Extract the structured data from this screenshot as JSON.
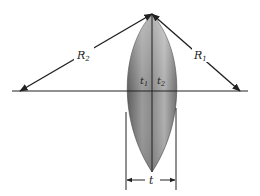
{
  "diagram": {
    "title": "",
    "labels": {
      "r2": "R",
      "r2_sub": "2",
      "r1": "R",
      "r1_sub": "1",
      "t1": "t",
      "t1_sub": "1",
      "t2": "t",
      "t2_sub": "2",
      "t": "t"
    },
    "colors": {
      "line": "#222222",
      "lens_light": "#cfcfcf",
      "lens_dark": "#6a6a6a",
      "background": "#ffffff"
    }
  }
}
